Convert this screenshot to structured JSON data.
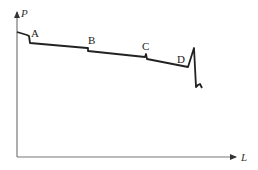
{
  "diagram": {
    "type": "pressure-along-length",
    "axes": {
      "y_label": "P",
      "x_label": "L"
    },
    "points": [
      {
        "label": "A"
      },
      {
        "label": "B"
      },
      {
        "label": "C"
      },
      {
        "label": "D"
      }
    ],
    "colors": {
      "axis": "#777777",
      "curve": "#222222",
      "background": "#ffffff"
    }
  }
}
